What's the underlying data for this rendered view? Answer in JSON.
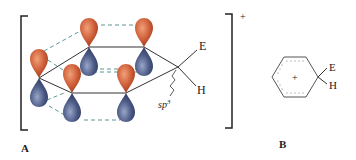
{
  "figure": {
    "charge_sign": "+",
    "panel_a": {
      "label": "A",
      "substituent_top": "E",
      "substituent_bottom": "H",
      "hybridization_label": "sp",
      "hybridization_superscript": "3"
    },
    "panel_b": {
      "label": "B",
      "ring_charge": "+",
      "substituent_top": "E",
      "substituent_bottom": "H"
    },
    "colors": {
      "orbital_top": "#d0603a",
      "orbital_bottom": "#4c5a86",
      "overlap_dash": "#4a8a8a",
      "bond": "#333333"
    }
  }
}
